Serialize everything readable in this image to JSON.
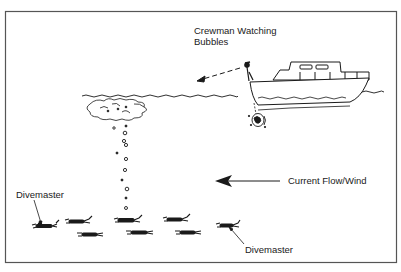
{
  "diagram": {
    "type": "illustration",
    "colors": {
      "ink": "#1a1a1a",
      "border": "#555555",
      "background": "#ffffff"
    },
    "labels": {
      "crewman_line1": "Crewman Watching",
      "crewman_line2": "Bubbles",
      "current": "Current Flow/Wind",
      "divemaster_left": "Divemaster",
      "divemaster_right": "Divemaster"
    },
    "elements": {
      "boat": "motor-boat-icon",
      "crewman": "crewman-figure",
      "bubble_cloud": "surface-bubbles-icon",
      "bubble_column": "bubble-trail",
      "current_arrow": "arrow-left-icon",
      "divers_count": 8
    }
  }
}
